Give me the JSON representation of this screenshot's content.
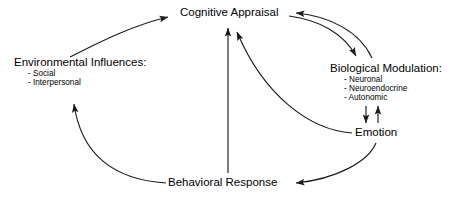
{
  "diagram": {
    "stroke_color": "#1a1a1a",
    "background_color": "#ffffff",
    "text_color": "#000000",
    "nodes": {
      "cognitive_appraisal": {
        "label": "Cognitive Appraisal"
      },
      "environmental_influences": {
        "label": "Environmental Influences:",
        "bullets": [
          "- Social",
          "- Interpersonal"
        ]
      },
      "biological_modulation": {
        "label": "Biological Modulation:",
        "bullets": [
          "- Neuronal",
          "- Neuroendocrine",
          "- Autonomic"
        ]
      },
      "emotion": {
        "label": "Emotion"
      },
      "behavioral_response": {
        "label": "Behavioral Response"
      }
    },
    "edges": [
      {
        "name": "environmental-to-cognitive",
        "from": "environmental_influences",
        "to": "cognitive_appraisal",
        "style": "curved",
        "direction": "one-way"
      },
      {
        "name": "cognitive-to-biological",
        "from": "cognitive_appraisal",
        "to": "biological_modulation",
        "style": "curved",
        "direction": "one-way"
      },
      {
        "name": "biological-to-cognitive",
        "from": "biological_modulation",
        "to": "cognitive_appraisal",
        "style": "curved",
        "direction": "one-way"
      },
      {
        "name": "biological-to-emotion",
        "from": "biological_modulation",
        "to": "emotion",
        "style": "straight-vertical",
        "direction": "one-way"
      },
      {
        "name": "emotion-to-biological",
        "from": "emotion",
        "to": "biological_modulation",
        "style": "straight-vertical",
        "direction": "one-way"
      },
      {
        "name": "emotion-to-cognitive",
        "from": "emotion",
        "to": "cognitive_appraisal",
        "style": "curved",
        "direction": "one-way"
      },
      {
        "name": "emotion-to-behavioral",
        "from": "emotion",
        "to": "behavioral_response",
        "style": "curved",
        "direction": "one-way"
      },
      {
        "name": "behavioral-to-cognitive",
        "from": "behavioral_response",
        "to": "cognitive_appraisal",
        "style": "straight-vertical",
        "direction": "one-way"
      },
      {
        "name": "behavioral-to-environmental",
        "from": "behavioral_response",
        "to": "environmental_influences",
        "style": "curved",
        "direction": "one-way"
      }
    ]
  }
}
